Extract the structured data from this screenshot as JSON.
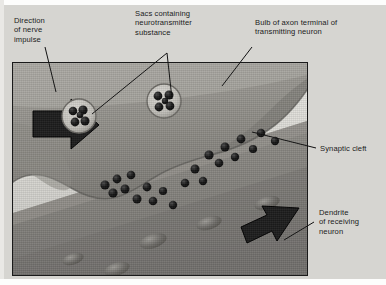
{
  "figure": {
    "background_color": "#d6d5d1",
    "frame_border_color": "#1a1a1a"
  },
  "labels": {
    "direction_of_nerve_impulse": "Direction\nof nerve\nimpulse",
    "sacs_containing_neurotransmitter": "Sacs containing\nneurotransmitter\nsubstance",
    "bulb_of_axon_terminal": "Bulb of axon terminal of\ntransmitting neuron",
    "synaptic_cleft": "Synaptic cleft",
    "dendrite_of_receiving_neuron": "Dendrite\nof receiving\nneuron"
  },
  "structures": {
    "axon_bulb_name": "axon-terminal-bulb",
    "synaptic_cleft_name": "synaptic-cleft",
    "dendrite_name": "dendrite-membrane",
    "vesicle_name": "synaptic-vesicle",
    "neurotransmitter_name": "neurotransmitter-molecule",
    "receptor_name": "receptor-site",
    "impulse_arrow_name": "impulse-direction-arrow"
  },
  "colors": {
    "axon_fill": "#9c9a94",
    "cleft_fill": "#d9d8d3",
    "dendrite_fill": "#8d8b86",
    "arrow_fill": "#1d1d1d",
    "vesicle_fill": "#c9c7c1",
    "molecule_fill": "#151515",
    "label_text": "#1b1b1b"
  },
  "counts": {
    "vesicles": 2,
    "molecules_in_vesicle_left": 5,
    "molecules_in_vesicle_right": 5,
    "molecules_in_cleft": 21,
    "receptor_sites": 5
  }
}
